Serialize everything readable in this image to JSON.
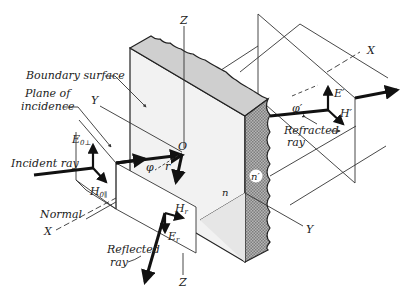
{
  "diagram": {
    "type": "physics-illustration",
    "labels": {
      "boundary_surface": "Boundary surface",
      "plane_of_incidence_line1": "Plane of",
      "plane_of_incidence_line2": "incidence",
      "incident_ray": "Incident ray",
      "normal": "Normal",
      "reflected_ray_line1": "Reflected",
      "reflected_ray_line2": "ray",
      "refracted_ray_line1": "Refracted",
      "refracted_ray_line2": "ray"
    },
    "axes": {
      "z_top": "Z",
      "z_bottom": "Z",
      "y_left": "Y",
      "y_right": "Y",
      "x_left": "X",
      "x_right": "X"
    },
    "points": {
      "origin": "O"
    },
    "angles": {
      "incidence": "φ",
      "reflection": "r",
      "refraction": "φ′"
    },
    "media": {
      "n1": "n",
      "n2": "n′"
    },
    "vectors": {
      "incident_E": "E",
      "incident_E_sub": "0⊥",
      "incident_H": "H",
      "incident_H_sub": "0∥",
      "reflected_H": "H",
      "reflected_H_sub": "r",
      "reflected_E": "E",
      "reflected_E_sub": "r",
      "refracted_E": "E′",
      "refracted_H": "H′"
    },
    "colors": {
      "slab_top": "#cfcfcf",
      "slab_face": "#f2f2f2",
      "slab_side": "#9a9a9a",
      "ink": "#111111"
    }
  }
}
